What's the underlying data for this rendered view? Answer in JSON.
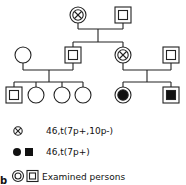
{
  "diagram": {
    "type": "pedigree",
    "panel_label": "b",
    "generations": [
      {
        "id": "I",
        "members": [
          {
            "sex": "female",
            "status": "carrier-balanced",
            "examined": true
          },
          {
            "sex": "male",
            "status": "normal",
            "examined": true
          }
        ]
      },
      {
        "id": "II",
        "members": [
          {
            "sex": "female",
            "status": "normal",
            "examined": false
          },
          {
            "sex": "male",
            "status": "normal",
            "examined": true
          },
          {
            "sex": "female",
            "status": "carrier-balanced",
            "examined": true
          },
          {
            "sex": "male",
            "status": "normal",
            "examined": true
          }
        ]
      },
      {
        "id": "III",
        "members": [
          {
            "sex": "male",
            "status": "normal",
            "examined": true
          },
          {
            "sex": "female",
            "status": "normal",
            "examined": false
          },
          {
            "sex": "female",
            "status": "normal",
            "examined": false
          },
          {
            "sex": "female",
            "status": "normal",
            "examined": false
          },
          {
            "sex": "female",
            "status": "affected",
            "examined": true
          },
          {
            "sex": "male",
            "status": "affected",
            "examined": true
          }
        ]
      }
    ]
  },
  "legend": {
    "carrier_label": "46,t(7p+,10p-)",
    "affected_label": "46,t(7p+)",
    "examined_label": "Examined persons"
  }
}
